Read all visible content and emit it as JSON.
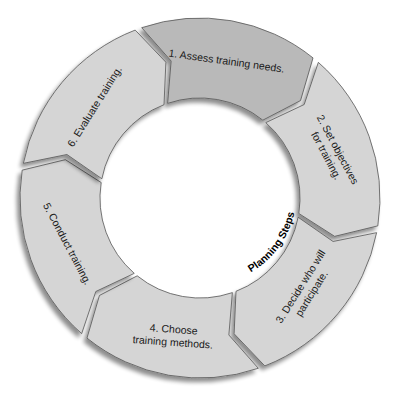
{
  "diagram": {
    "type": "cycle",
    "center_label": "Planning Steps",
    "colors": {
      "highlight_fill": "#b9b9b9",
      "segment_fill": "#d5d5d5",
      "stroke": "#555555",
      "shadow": "#9a9a9a",
      "text": "#1a1a1a"
    },
    "steps": [
      {
        "number": 1,
        "lines": [
          "1. Assess training needs."
        ]
      },
      {
        "number": 2,
        "lines": [
          "2. Set objectives",
          "for training."
        ]
      },
      {
        "number": 3,
        "lines": [
          "3. Decide who will",
          "participate."
        ]
      },
      {
        "number": 4,
        "lines": [
          "4. Choose",
          "training methods."
        ]
      },
      {
        "number": 5,
        "lines": [
          "5. Conduct training."
        ]
      },
      {
        "number": 6,
        "lines": [
          "6. Evaluate training."
        ]
      }
    ]
  }
}
